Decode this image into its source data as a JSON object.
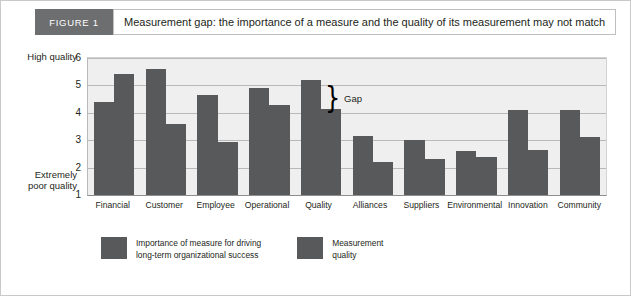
{
  "figure": {
    "badge": "FIGURE 1",
    "title": "Measurement gap: the importance of a measure and the quality of its measurement may not match"
  },
  "axis": {
    "y_cap_high": "High quality",
    "y_cap_low": "Extremely\npoor quality",
    "y_ticks": [
      "6",
      "5",
      "4",
      "3",
      "2",
      "1"
    ]
  },
  "annotation": {
    "brace_glyph": "}",
    "gap_label": "Gap"
  },
  "legend": {
    "items": [
      {
        "label": "Importance of measure for driving\nlong-term organizational success",
        "color": "#58595b"
      },
      {
        "label": "Measurement\nquality",
        "color": "#58595b"
      }
    ]
  },
  "chart_data": {
    "type": "bar",
    "title": "Measurement gap: the importance of a measure and the quality of its measurement may not match",
    "xlabel": "",
    "ylabel": "",
    "ylim": [
      1,
      6
    ],
    "yticks": [
      1,
      2,
      3,
      4,
      5,
      6
    ],
    "y_axis_low_label": "Extremely poor quality",
    "y_axis_high_label": "High quality",
    "grid": true,
    "legend_position": "bottom",
    "categories": [
      "Financial",
      "Customer",
      "Employee",
      "Operational",
      "Quality",
      "Alliances",
      "Suppliers",
      "Environmental",
      "Innovation",
      "Community"
    ],
    "series": [
      {
        "name": "Importance of measure for driving long-term organizational success",
        "color": "#58595b",
        "values": [
          4.4,
          5.6,
          4.65,
          4.9,
          5.2,
          3.15,
          3.0,
          2.6,
          4.1,
          4.1
        ]
      },
      {
        "name": "Measurement quality",
        "color": "#58595b",
        "values": [
          5.4,
          3.6,
          2.95,
          4.3,
          4.15,
          2.2,
          2.3,
          2.4,
          2.65,
          3.1
        ]
      }
    ],
    "annotations": [
      {
        "text": "Gap",
        "category": "Quality",
        "from": 4.15,
        "to": 5.2,
        "style": "brace"
      }
    ]
  }
}
